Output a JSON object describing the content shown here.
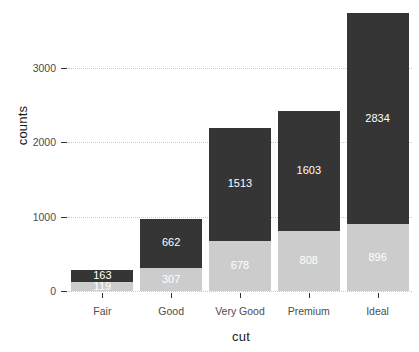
{
  "chart_data": {
    "type": "bar",
    "subtype": "stacked-bar",
    "title": "",
    "xlabel": "cut",
    "ylabel": "counts",
    "categories": [
      "Fair",
      "Good",
      "Very Good",
      "Premium",
      "Ideal"
    ],
    "series": [
      {
        "name": "lower-segment",
        "color": "#cccccc",
        "label_color": "#ffffff",
        "values": [
          119,
          307,
          678,
          808,
          896
        ]
      },
      {
        "name": "upper-segment",
        "color": "#353535",
        "label_color": "#ffffff",
        "values": [
          163,
          662,
          1513,
          1603,
          2834
        ]
      }
    ],
    "totals": [
      282,
      969,
      2191,
      2411,
      3730
    ],
    "ylim": [
      0,
      3800
    ],
    "y_ticks": [
      0,
      1000,
      2000,
      3000
    ],
    "y_tick_labels": [
      "0",
      "1000",
      "2000",
      "3000"
    ],
    "grid": "horizontal-dotted",
    "legend": "none",
    "bar_labels": {
      "Fair": {
        "light": "119",
        "dark": "163"
      },
      "Good": {
        "light": "307",
        "dark": "662"
      },
      "Very Good": {
        "light": "678",
        "dark": "1513"
      },
      "Premium": {
        "light": "808",
        "dark": "1603"
      },
      "Ideal": {
        "light": "896",
        "dark": "2834"
      }
    },
    "panel_background": "#ffffff",
    "gridline_color": "#c8c8c8",
    "axis_text_color": "#4d4d4d",
    "axis_title_color": "#1a1a1a"
  }
}
